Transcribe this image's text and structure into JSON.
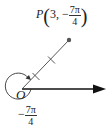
{
  "diagram": {
    "type": "polar-coordinate-plot",
    "point": {
      "name": "P",
      "r": "3",
      "theta_sign": "−",
      "theta_num": "7π",
      "theta_den": "4",
      "separator": ","
    },
    "origin_label": "O",
    "angle_label": {
      "sign": "−",
      "num": "7π",
      "den": "4"
    },
    "ray_tick_count": 2,
    "colors": {
      "line": "#333333",
      "axis": "#111111",
      "point": "#555555"
    }
  }
}
